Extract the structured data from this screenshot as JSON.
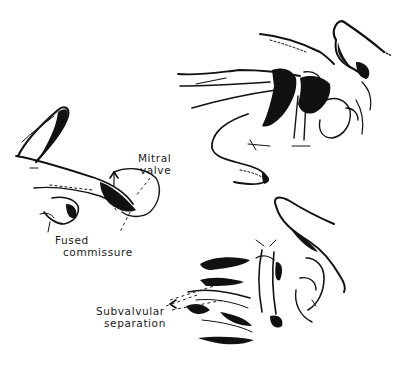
{
  "figure": {
    "background": "#ffffff",
    "ink_color": "#111111",
    "panels": [
      {
        "id": "left",
        "description": "Finger inserted through atrial appendage toward mitral valve orifice",
        "labels": [
          {
            "line1": "Mitral",
            "line2": "valve"
          },
          {
            "line1": "Fused",
            "line2": "commissure"
          }
        ]
      },
      {
        "id": "top-right",
        "description": "Finger splitting fused commissure of mitral valve"
      },
      {
        "id": "bottom-right",
        "description": "Subvalvular apparatus being separated",
        "labels": [
          {
            "line1": "Subvalvular",
            "line2": "separation"
          }
        ]
      }
    ]
  }
}
